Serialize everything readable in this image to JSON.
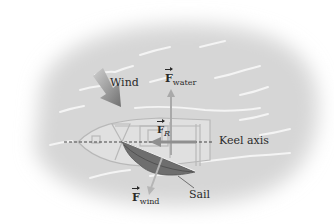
{
  "figure": {
    "type": "physics force diagram"
  },
  "labels": {
    "wind": "Wind",
    "keel_axis": "Keel axis",
    "sail": "Sail",
    "f_water_symbol": "F",
    "f_water_sub": "water",
    "f_r_symbol": "F",
    "f_r_sub": "R",
    "f_wind_symbol": "F",
    "f_wind_sub": "wind"
  },
  "vectors": [
    {
      "name": "F_water",
      "direction": "up (perpendicular to keel)"
    },
    {
      "name": "F_R",
      "direction": "left along keel axis"
    },
    {
      "name": "F_wind",
      "direction": "down-left, perpendicular to sail"
    }
  ],
  "colors": {
    "water": "#dcdcdc",
    "sail": "#6e6e6e",
    "arrow": "#a9a9a9",
    "wind_arrow": "#7d7d7d",
    "text": "#2a2a2a"
  }
}
